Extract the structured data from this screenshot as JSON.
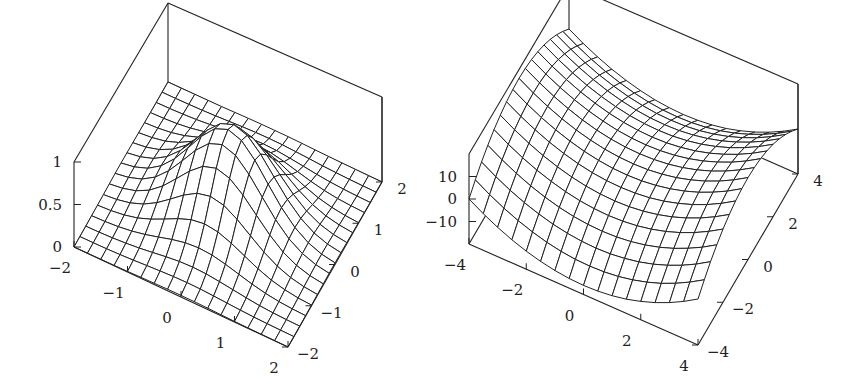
{
  "chart_data": [
    {
      "type": "surface",
      "title": "",
      "function": "exp(-(x^2+y^2))",
      "xlabel": "",
      "ylabel": "",
      "zlabel": "",
      "xlim": [
        -2,
        2
      ],
      "ylim": [
        -2,
        2
      ],
      "zlim": [
        0,
        1
      ],
      "x_ticks": [
        -2,
        -1,
        0,
        1,
        2
      ],
      "x_tick_labels": [
        "−2",
        "−1",
        "0",
        "1",
        "2"
      ],
      "y_ticks": [
        -2,
        -1,
        0,
        1,
        2
      ],
      "y_tick_labels": [
        "−2",
        "−1",
        "0",
        "1",
        "2"
      ],
      "z_ticks": [
        0,
        0.5,
        1
      ],
      "z_tick_labels": [
        "0",
        "0.5",
        "1"
      ],
      "grid_n": 16,
      "box_corners_px": {
        "x_min_y_min_z_min": [
          74,
          247
        ],
        "x_max_y_min_z_min": [
          288,
          347
        ],
        "x_max_y_max_z_min": [
          382,
          182
        ],
        "z_span_px": 91,
        "z_span_back_px": 79
      }
    },
    {
      "type": "surface",
      "title": "",
      "function": "x^2 - y^2",
      "xlabel": "",
      "ylabel": "",
      "zlabel": "",
      "xlim": [
        -4,
        4
      ],
      "ylim": [
        -4,
        4
      ],
      "zlim": [
        -20,
        20
      ],
      "x_ticks": [
        -4,
        -2,
        0,
        2,
        4
      ],
      "x_tick_labels": [
        "−4",
        "−2",
        "0",
        "2",
        "4"
      ],
      "y_ticks": [
        -4,
        -2,
        0,
        2,
        4
      ],
      "y_tick_labels": [
        "−4",
        "−2",
        "0",
        "2",
        "4"
      ],
      "z_ticks": [
        -10,
        0,
        10
      ],
      "z_tick_labels": [
        "−10",
        "0",
        "10"
      ],
      "grid_n": 16,
      "box_corners_px": {
        "x_min_y_min_z_min": [
          469,
          244
        ],
        "x_max_y_min_z_min": [
          698,
          345
        ],
        "x_max_y_max_z_min": [
          798,
          174
        ],
        "z_span_px": 92,
        "z_span_back_px": 88
      }
    }
  ]
}
